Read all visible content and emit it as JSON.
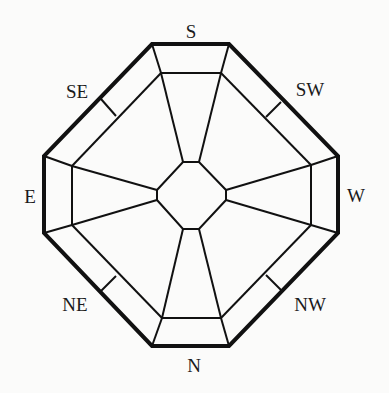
{
  "diagram": {
    "type": "octagonal compass / bagua grid",
    "background": "#fbfbfa",
    "stroke_color": "#111111",
    "labels": {
      "south": "S",
      "southwest": "SW",
      "west": "W",
      "northwest": "NW",
      "north": "N",
      "northeast": "NE",
      "east": "E",
      "southeast": "SE"
    },
    "orientation_note": "South at top, North at bottom, East on left, West on right"
  }
}
